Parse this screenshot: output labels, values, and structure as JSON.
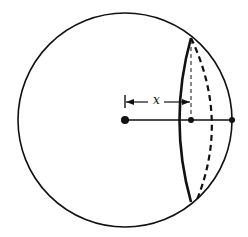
{
  "diagram": {
    "labels": {
      "distance": "x"
    },
    "geometry": {
      "circle": {
        "cx": 125,
        "cy": 120,
        "r": 107
      },
      "center_point": {
        "x": 125,
        "y": 120
      },
      "plane_point": {
        "x": 191,
        "y": 120
      },
      "edge_point": {
        "x": 232,
        "y": 120
      },
      "chord_top": {
        "x": 191,
        "y": 38
      },
      "chord_bottom": {
        "x": 191,
        "y": 202
      }
    },
    "colors": {
      "stroke": "#111111",
      "background": "#ffffff"
    }
  }
}
